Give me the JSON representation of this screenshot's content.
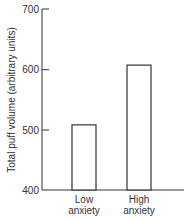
{
  "chart_data": {
    "type": "bar",
    "title": "",
    "xlabel": "",
    "ylabel": "Total puff volume (arbitrary units)",
    "categories": [
      "Low anxiety",
      "High anxiety"
    ],
    "category_lines": [
      [
        "Low",
        "anxiety"
      ],
      [
        "High",
        "anxiety"
      ]
    ],
    "values": [
      508,
      607
    ],
    "ylim": [
      400,
      700
    ],
    "yticks": [
      400,
      500,
      600,
      700
    ],
    "ytick_labels": [
      "400",
      "500",
      "600",
      "700"
    ],
    "grid": false,
    "legend": null,
    "bar_style": "outlined, white fill"
  }
}
